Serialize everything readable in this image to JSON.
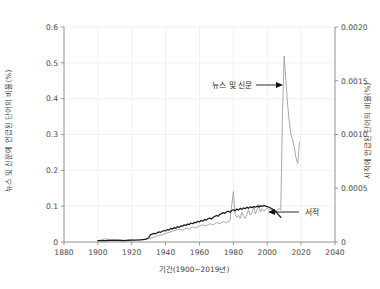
{
  "chart_data": {
    "type": "line",
    "title": "",
    "xlabel": "기간(1900~2019년)",
    "ylabel": "뉴스 및 신문에 언급된 단어의 비율(%)",
    "ylabel_right": "서적에 언급된 단어의 비율(%)",
    "grid": true,
    "legend_position": "inline-annotations",
    "xlim": [
      1880,
      2040
    ],
    "ylim": [
      0,
      0.6
    ],
    "ylim_right": [
      0,
      0.002
    ],
    "xticks": [
      1880,
      1900,
      1920,
      1940,
      1960,
      1980,
      2000,
      2020,
      2040
    ],
    "xtick_labels": [
      "1880",
      "1900",
      "1920",
      "1940",
      "1960",
      "1980",
      "2000",
      "2020",
      "2040"
    ],
    "yticks": [
      0,
      0.1,
      0.2,
      0.3,
      0.4,
      0.5,
      0.6
    ],
    "ytick_labels": [
      "0",
      "0.1",
      "0.2",
      "0.3",
      "0.4",
      "0.5",
      "0.6"
    ],
    "yticks_right": [
      0,
      0.0005,
      0.001,
      0.0015,
      0.002
    ],
    "ytick_labels_right": [
      "0",
      "0.0005",
      "0.0010",
      "0.0015",
      "0.0020"
    ],
    "annotations": [
      {
        "text": "뉴스 및 신문",
        "series": "news",
        "direction": "right"
      },
      {
        "text": "서적",
        "series": "books",
        "direction": "left"
      }
    ],
    "series": [
      {
        "name": "뉴스 및 신문",
        "axis": "right",
        "color": "#9a9a9a",
        "x": [
          1900,
          1902,
          1904,
          1906,
          1908,
          1910,
          1912,
          1914,
          1916,
          1918,
          1920,
          1922,
          1924,
          1926,
          1928,
          1930,
          1932,
          1934,
          1936,
          1938,
          1940,
          1942,
          1944,
          1946,
          1948,
          1950,
          1952,
          1954,
          1956,
          1958,
          1960,
          1962,
          1964,
          1966,
          1968,
          1970,
          1972,
          1974,
          1976,
          1978,
          1980,
          1981,
          1982,
          1983,
          1984,
          1985,
          1986,
          1987,
          1988,
          1989,
          1990,
          1991,
          1992,
          1993,
          1994,
          1995,
          1996,
          1997,
          1998,
          1999,
          2000,
          2001,
          2002,
          2003,
          2004,
          2005,
          2006,
          2007,
          2008,
          2009,
          2010,
          2011,
          2012,
          2013,
          2014,
          2015,
          2016,
          2017,
          2018,
          2019
        ],
        "values": [
          1e-05,
          2e-05,
          3e-05,
          2.5e-05,
          2e-05,
          1.5e-05,
          2e-05,
          1.8e-05,
          1.5e-05,
          2e-05,
          1.8e-05,
          1.6e-05,
          2e-05,
          2.2e-05,
          2.5e-05,
          3e-05,
          4e-05,
          5e-05,
          6e-05,
          7e-05,
          8e-05,
          9e-05,
          0.0001,
          0.00011,
          0.00012,
          0.00011,
          0.00013,
          0.00012,
          0.00014,
          0.00013,
          0.00015,
          0.00016,
          0.00015,
          0.00017,
          0.00016,
          0.00018,
          0.00017,
          0.00019,
          0.00018,
          0.0002,
          0.00047,
          0.00026,
          0.00023,
          0.00025,
          0.00022,
          0.00028,
          0.00024,
          0.00022,
          0.00026,
          0.0003,
          0.00025,
          0.00027,
          0.00033,
          0.00026,
          0.0003,
          0.00035,
          0.00028,
          0.00031,
          0.00029,
          0.0003,
          0.00032,
          0.0003,
          0.00031,
          0.00029,
          0.0003,
          0.00029,
          0.0003,
          0.00031,
          0.0003,
          0.0012,
          0.00173,
          0.0015,
          0.00128,
          0.00112,
          0.001,
          0.00095,
          0.00088,
          0.00078,
          0.00073,
          0.00093
        ]
      },
      {
        "name": "서적",
        "axis": "left",
        "color": "#1a1a1a",
        "x": [
          1900,
          1905,
          1910,
          1915,
          1920,
          1925,
          1928,
          1930,
          1931,
          1932,
          1933,
          1934,
          1935,
          1936,
          1937,
          1938,
          1939,
          1940,
          1941,
          1942,
          1943,
          1944,
          1945,
          1946,
          1947,
          1948,
          1949,
          1950,
          1951,
          1952,
          1953,
          1954,
          1955,
          1956,
          1957,
          1958,
          1959,
          1960,
          1961,
          1962,
          1963,
          1964,
          1965,
          1966,
          1967,
          1968,
          1969,
          1970,
          1971,
          1972,
          1973,
          1974,
          1975,
          1976,
          1977,
          1978,
          1979,
          1980,
          1981,
          1982,
          1983,
          1984,
          1985,
          1986,
          1987,
          1988,
          1989,
          1990,
          1991,
          1992,
          1993,
          1994,
          1995,
          1996,
          1997,
          1998,
          1999,
          2000,
          2001,
          2002,
          2003,
          2004,
          2005,
          2006,
          2007,
          2008
        ],
        "values": [
          0.004,
          0.004,
          0.005,
          0.004,
          0.005,
          0.006,
          0.007,
          0.012,
          0.02,
          0.022,
          0.024,
          0.023,
          0.026,
          0.028,
          0.027,
          0.03,
          0.032,
          0.031,
          0.035,
          0.033,
          0.038,
          0.036,
          0.04,
          0.038,
          0.043,
          0.041,
          0.045,
          0.044,
          0.048,
          0.046,
          0.05,
          0.049,
          0.053,
          0.051,
          0.055,
          0.054,
          0.058,
          0.056,
          0.06,
          0.058,
          0.063,
          0.061,
          0.065,
          0.067,
          0.064,
          0.069,
          0.071,
          0.074,
          0.072,
          0.077,
          0.079,
          0.082,
          0.08,
          0.084,
          0.086,
          0.083,
          0.088,
          0.09,
          0.087,
          0.092,
          0.089,
          0.094,
          0.091,
          0.095,
          0.093,
          0.097,
          0.094,
          0.098,
          0.096,
          0.099,
          0.097,
          0.1,
          0.098,
          0.101,
          0.099,
          0.102,
          0.1,
          0.099,
          0.097,
          0.095,
          0.092,
          0.089,
          0.085,
          0.08,
          0.074,
          0.069
        ]
      }
    ]
  }
}
